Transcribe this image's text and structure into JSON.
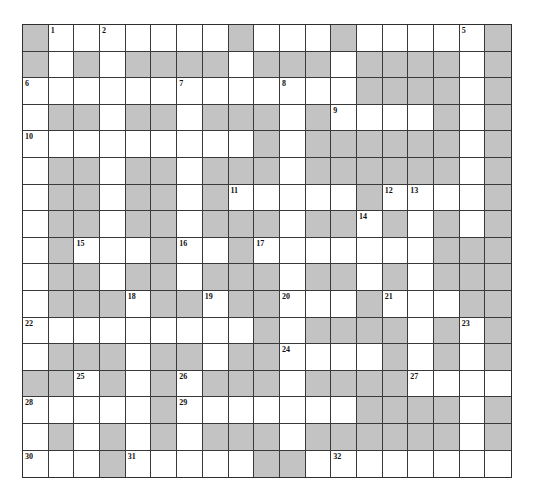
{
  "puzzle": {
    "rows": 17,
    "cols": 19,
    "colors": {
      "block": "#c3c3c3",
      "open": "#ffffff",
      "grid_line": "#3a3a3a"
    },
    "grid": [
      "#.......#...#.....#",
      "#.#.####.###.####.#",
      ".............####.#",
      ".##.##.###.#....#.#",
      ".........#.######.#",
      ".##.##.###.######.#",
      ".##.##.#.....#....#",
      ".##.##.###.##.#.#.#",
      ".#...#..#.......###",
      ".##.##.###.##.#.###",
      ".###.##.##...#...##",
      ".........#.####.#.#",
      ".###.##.##....#.#.#",
      "##.#.#.###.####....",
      ".....#.......####.#",
      ".#.#.#.###.######.#",
      "...#.....##......."
    ],
    "numbers": [
      {
        "row": 0,
        "col": 1,
        "n": "1"
      },
      {
        "row": 0,
        "col": 3,
        "n": "2"
      },
      {
        "row": 0,
        "col": 8,
        "n": "3"
      },
      {
        "row": 0,
        "col": 12,
        "n": "4"
      },
      {
        "row": 0,
        "col": 17,
        "n": "5"
      },
      {
        "row": 2,
        "col": 0,
        "n": "6"
      },
      {
        "row": 2,
        "col": 6,
        "n": "7"
      },
      {
        "row": 2,
        "col": 10,
        "n": "8"
      },
      {
        "row": 3,
        "col": 12,
        "n": "9"
      },
      {
        "row": 4,
        "col": 0,
        "n": "10"
      },
      {
        "row": 6,
        "col": 8,
        "n": "11"
      },
      {
        "row": 6,
        "col": 14,
        "n": "12"
      },
      {
        "row": 6,
        "col": 15,
        "n": "13"
      },
      {
        "row": 7,
        "col": 13,
        "n": "14"
      },
      {
        "row": 8,
        "col": 2,
        "n": "15"
      },
      {
        "row": 8,
        "col": 6,
        "n": "16"
      },
      {
        "row": 8,
        "col": 9,
        "n": "17"
      },
      {
        "row": 10,
        "col": 4,
        "n": "18"
      },
      {
        "row": 10,
        "col": 7,
        "n": "19"
      },
      {
        "row": 10,
        "col": 10,
        "n": "20"
      },
      {
        "row": 10,
        "col": 14,
        "n": "21"
      },
      {
        "row": 11,
        "col": 0,
        "n": "22"
      },
      {
        "row": 11,
        "col": 17,
        "n": "23"
      },
      {
        "row": 12,
        "col": 10,
        "n": "24"
      },
      {
        "row": 13,
        "col": 2,
        "n": "25"
      },
      {
        "row": 13,
        "col": 6,
        "n": "26"
      },
      {
        "row": 13,
        "col": 15,
        "n": "27"
      },
      {
        "row": 14,
        "col": 0,
        "n": "28"
      },
      {
        "row": 14,
        "col": 6,
        "n": "29"
      },
      {
        "row": 16,
        "col": 0,
        "n": "30"
      },
      {
        "row": 16,
        "col": 4,
        "n": "31"
      },
      {
        "row": 16,
        "col": 12,
        "n": "32"
      }
    ]
  }
}
